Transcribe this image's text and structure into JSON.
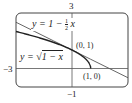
{
  "chart_data": {
    "type": "line",
    "title": "",
    "xlabel": "",
    "ylabel": "",
    "xlim": [
      -3,
      3
    ],
    "ylim": [
      -1,
      3
    ],
    "grid": false,
    "tick_labels": {
      "x_min": "−3",
      "y_max": "3",
      "y_min": "−1"
    },
    "series": [
      {
        "name": "y = 1 − ½ x",
        "kind": "tangent_line",
        "x": [
          -3,
          -2,
          -1,
          0,
          1,
          2,
          3
        ],
        "y": [
          2.5,
          2,
          1.5,
          1,
          0.5,
          0,
          -0.5
        ],
        "color": "#555555"
      },
      {
        "name": "y = √(1 − x)",
        "kind": "curve",
        "x": [
          -3,
          -2,
          -1,
          0,
          0.5,
          0.75,
          0.9,
          1
        ],
        "y": [
          2,
          1.732,
          1.414,
          1,
          0.707,
          0.5,
          0.316,
          0
        ],
        "color": "#222222"
      }
    ],
    "annotations": [
      {
        "text": "(0, 1)",
        "x": 0,
        "y": 1
      },
      {
        "text": "(1, 0)",
        "x": 1,
        "y": 0
      }
    ],
    "legend": "inline labels"
  },
  "labels": {
    "tick_y_max": "3",
    "tick_x_min": "−3",
    "tick_y_min": "−1",
    "eq_line_prefix": "y = 1 − ",
    "eq_line_frac_num": "1",
    "eq_line_frac_den": "2",
    "eq_line_suffix": " x",
    "eq_curve_prefix": "y = ",
    "eq_curve_radical": "√",
    "eq_curve_radicand": "1 − x",
    "point_a": "(0, 1)",
    "point_b": "(1, 0)"
  },
  "colors": {
    "frame": "#444444",
    "axes": "#555555",
    "line": "#555555",
    "curve": "#222222"
  }
}
